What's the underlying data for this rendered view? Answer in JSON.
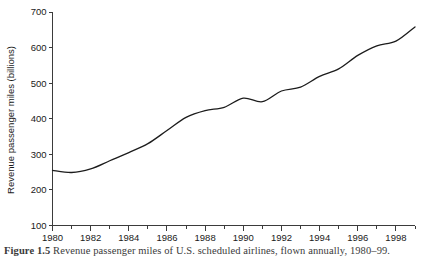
{
  "figure": {
    "caption_label": "Figure 1.5",
    "caption_text": "Revenue passenger miles of U.S. scheduled airlines, flown annually, 1980–99.",
    "background_color": "#ffffff",
    "line_color": "#1c1c1c",
    "axis_color": "#3b3b3b"
  },
  "axes": {
    "y_label": "Revenue passenger miles (billions)",
    "y_ticks": [
      700,
      600,
      500,
      400,
      300,
      200,
      100
    ],
    "y_tick_labels": [
      "700",
      "600",
      "500",
      "400",
      "300",
      "200",
      "100"
    ],
    "y_min": 100,
    "y_max": 700,
    "x_min": 1980,
    "x_max": 1999,
    "x_tick_labels": [
      "1980",
      "1982",
      "1984",
      "1986",
      "1988",
      "1990",
      "1992",
      "1994",
      "1996",
      "1998"
    ],
    "x_major_ticks": [
      1980,
      1982,
      1984,
      1986,
      1988,
      1990,
      1992,
      1994,
      1996,
      1998
    ],
    "x_minor_ticks": [
      1981,
      1983,
      1985,
      1987,
      1989,
      1991,
      1993,
      1995,
      1997,
      1999
    ]
  },
  "chart_data": {
    "type": "line",
    "title": "",
    "xlabel": "",
    "ylabel": "Revenue passenger miles (billions)",
    "xlim": [
      1980,
      1999
    ],
    "ylim": [
      100,
      700
    ],
    "grid": false,
    "legend": false,
    "x": [
      1980,
      1981,
      1982,
      1983,
      1984,
      1985,
      1986,
      1987,
      1988,
      1989,
      1990,
      1991,
      1992,
      1993,
      1994,
      1995,
      1996,
      1997,
      1998,
      1999
    ],
    "series": [
      {
        "name": "Revenue passenger miles",
        "values": [
          255,
          249,
          259,
          282,
          305,
          330,
          367,
          404,
          423,
          432,
          458,
          448,
          478,
          489,
          519,
          540,
          578,
          605,
          618,
          658
        ]
      }
    ],
    "annotations": []
  }
}
